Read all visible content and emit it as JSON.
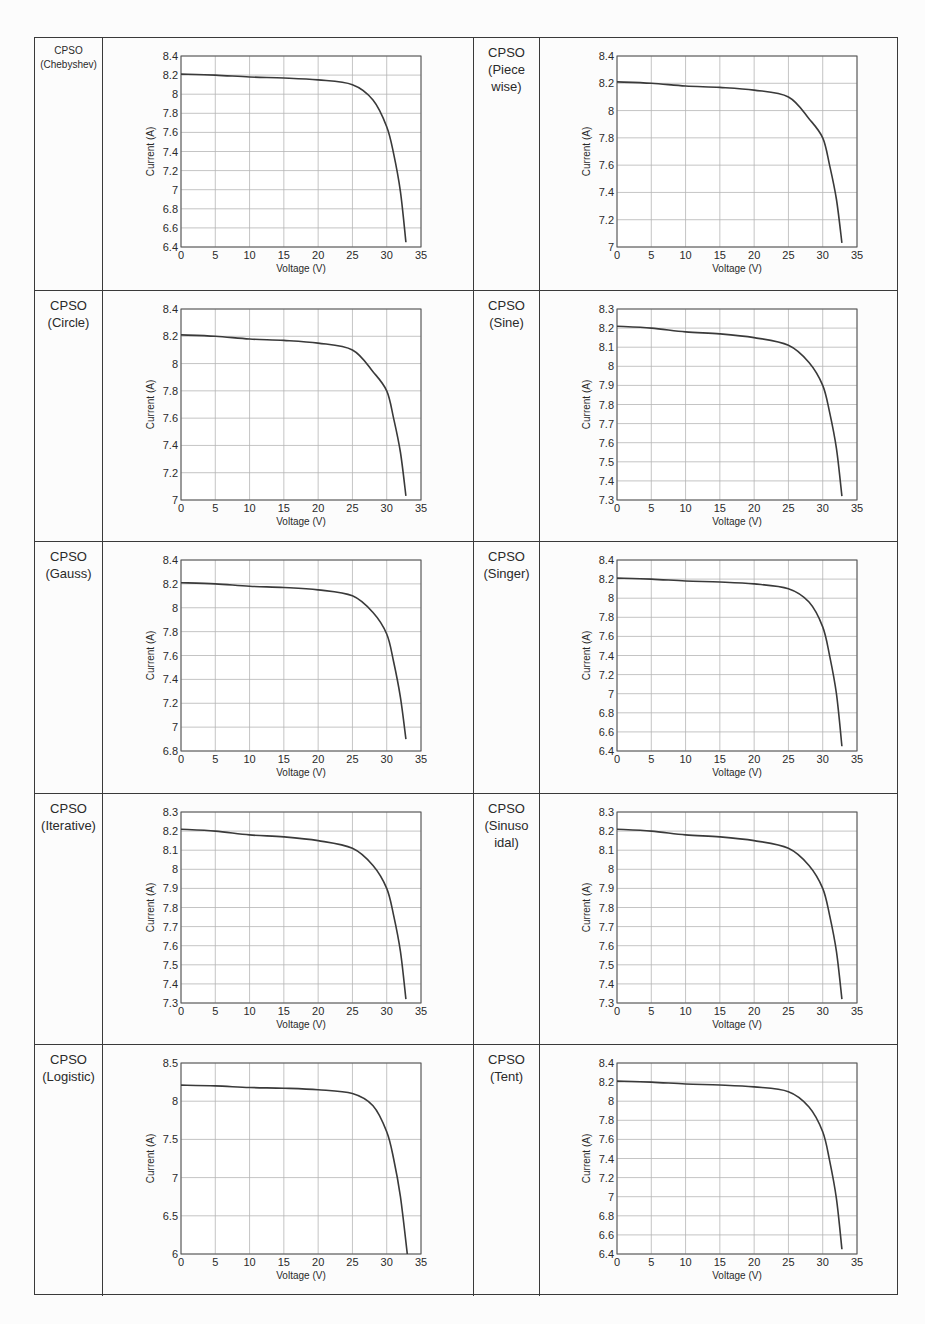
{
  "table": {
    "rows": [
      {
        "left": {
          "label": [
            "CPSO",
            "(Chebyshev)"
          ],
          "small": true,
          "chart_index": 0
        },
        "right": {
          "label": [
            "CPSO",
            "(Piece",
            "wise)"
          ],
          "small": false,
          "chart_index": 1
        }
      },
      {
        "left": {
          "label": [
            "CPSO",
            "(Circle)"
          ],
          "small": false,
          "chart_index": 2
        },
        "right": {
          "label": [
            "CPSO",
            "(Sine)"
          ],
          "small": false,
          "chart_index": 3
        }
      },
      {
        "left": {
          "label": [
            "CPSO",
            "(Gauss)"
          ],
          "small": false,
          "chart_index": 4
        },
        "right": {
          "label": [
            "CPSO",
            "(Singer)"
          ],
          "small": false,
          "chart_index": 5
        }
      },
      {
        "left": {
          "label": [
            "CPSO",
            "(Iterative)"
          ],
          "small": false,
          "chart_index": 6
        },
        "right": {
          "label": [
            "CPSO",
            "(Sinuso",
            "idal)"
          ],
          "small": false,
          "chart_index": 7
        }
      },
      {
        "left": {
          "label": [
            "CPSO",
            "(Logistic)"
          ],
          "small": false,
          "chart_index": 8
        },
        "right": {
          "label": [
            "CPSO",
            "(Tent)"
          ],
          "small": false,
          "chart_index": 9
        }
      }
    ]
  },
  "style": {
    "line_color": "#3a3a3a",
    "grid_color": "#b5b5b5",
    "frame_color": "#555555",
    "border_color": "#3a3a3a"
  },
  "chart_data": [
    {
      "type": "line",
      "title": "CPSO (Chebyshev)",
      "xlabel": "Voltage (V)",
      "ylabel": "Current (A)",
      "xlim": [
        0,
        35
      ],
      "ylim": [
        6.4,
        8.4
      ],
      "grid": true,
      "xticks": [
        0,
        5,
        10,
        15,
        20,
        25,
        30,
        35
      ],
      "yticks": [
        6.4,
        6.6,
        6.8,
        7,
        7.2,
        7.4,
        7.6,
        7.8,
        8,
        8.2,
        8.4
      ],
      "ytick_labels": [
        "6.4",
        "6.6",
        "6.8",
        "7",
        "7.2",
        "7.4",
        "7.6",
        "7.8",
        "8",
        "8.2",
        "8.4"
      ],
      "series": [
        {
          "name": "I-V curve",
          "x": [
            0,
            5,
            10,
            15,
            20,
            25,
            28,
            30,
            31,
            32,
            32.8
          ],
          "y": [
            8.21,
            8.2,
            8.18,
            8.17,
            8.15,
            8.1,
            7.94,
            7.66,
            7.38,
            6.98,
            6.45
          ]
        }
      ]
    },
    {
      "type": "line",
      "title": "CPSO (Piece wise)",
      "xlabel": "Voltage (V)",
      "ylabel": "Current (A)",
      "xlim": [
        0,
        35
      ],
      "ylim": [
        7,
        8.4
      ],
      "grid": true,
      "xticks": [
        0,
        5,
        10,
        15,
        20,
        25,
        30,
        35
      ],
      "yticks": [
        7,
        7.2,
        7.4,
        7.6,
        7.8,
        8,
        8.2,
        8.4
      ],
      "ytick_labels": [
        "7",
        "7.2",
        "7.4",
        "7.6",
        "7.8",
        "8",
        "8.2",
        "8.4"
      ],
      "series": [
        {
          "name": "I-V curve",
          "x": [
            0,
            5,
            10,
            15,
            20,
            25,
            28,
            30,
            31,
            32,
            32.8
          ],
          "y": [
            8.21,
            8.2,
            8.18,
            8.17,
            8.15,
            8.1,
            7.94,
            7.8,
            7.6,
            7.35,
            7.03
          ]
        }
      ]
    },
    {
      "type": "line",
      "title": "CPSO (Circle)",
      "xlabel": "Voltage (V)",
      "ylabel": "Current (A)",
      "xlim": [
        0,
        35
      ],
      "ylim": [
        7,
        8.4
      ],
      "grid": true,
      "xticks": [
        0,
        5,
        10,
        15,
        20,
        25,
        30,
        35
      ],
      "yticks": [
        7,
        7.2,
        7.4,
        7.6,
        7.8,
        8,
        8.2,
        8.4
      ],
      "ytick_labels": [
        "7",
        "7.2",
        "7.4",
        "7.6",
        "7.8",
        "8",
        "8.2",
        "8.4"
      ],
      "series": [
        {
          "name": "I-V curve",
          "x": [
            0,
            5,
            10,
            15,
            20,
            25,
            28,
            30,
            31,
            32,
            32.8
          ],
          "y": [
            8.21,
            8.2,
            8.18,
            8.17,
            8.15,
            8.1,
            7.94,
            7.8,
            7.6,
            7.35,
            7.03
          ]
        }
      ]
    },
    {
      "type": "line",
      "title": "CPSO (Sine)",
      "xlabel": "Voltage (V)",
      "ylabel": "Current (A)",
      "xlim": [
        0,
        35
      ],
      "ylim": [
        7.3,
        8.3
      ],
      "grid": true,
      "xticks": [
        0,
        5,
        10,
        15,
        20,
        25,
        30,
        35
      ],
      "yticks": [
        7.3,
        7.4,
        7.5,
        7.6,
        7.7,
        7.8,
        7.9,
        8,
        8.1,
        8.2,
        8.3
      ],
      "ytick_labels": [
        "7.3",
        "7.4",
        "7.5",
        "7.6",
        "7.7",
        "7.8",
        "7.9",
        "8",
        "8.1",
        "8.2",
        "8.3"
      ],
      "series": [
        {
          "name": "I-V curve",
          "x": [
            0,
            5,
            10,
            15,
            20,
            25,
            28,
            30,
            31,
            32,
            32.8
          ],
          "y": [
            8.21,
            8.2,
            8.18,
            8.17,
            8.15,
            8.11,
            8.02,
            7.9,
            7.76,
            7.57,
            7.32
          ]
        }
      ]
    },
    {
      "type": "line",
      "title": "CPSO (Gauss)",
      "xlabel": "Voltage (V)",
      "ylabel": "Current (A)",
      "xlim": [
        0,
        35
      ],
      "ylim": [
        6.8,
        8.4
      ],
      "grid": true,
      "xticks": [
        0,
        5,
        10,
        15,
        20,
        25,
        30,
        35
      ],
      "yticks": [
        6.8,
        7,
        7.2,
        7.4,
        7.6,
        7.8,
        8,
        8.2,
        8.4
      ],
      "ytick_labels": [
        "6.8",
        "7",
        "7.2",
        "7.4",
        "7.6",
        "7.8",
        "8",
        "8.2",
        "8.4"
      ],
      "series": [
        {
          "name": "I-V curve",
          "x": [
            0,
            5,
            10,
            15,
            20,
            25,
            28,
            30,
            31,
            32,
            32.8
          ],
          "y": [
            8.21,
            8.2,
            8.18,
            8.17,
            8.15,
            8.1,
            7.96,
            7.78,
            7.55,
            7.25,
            6.9
          ]
        }
      ]
    },
    {
      "type": "line",
      "title": "CPSO (Singer)",
      "xlabel": "Voltage (V)",
      "ylabel": "Current (A)",
      "xlim": [
        0,
        35
      ],
      "ylim": [
        6.4,
        8.4
      ],
      "grid": true,
      "xticks": [
        0,
        5,
        10,
        15,
        20,
        25,
        30,
        35
      ],
      "yticks": [
        6.4,
        6.6,
        6.8,
        7,
        7.2,
        7.4,
        7.6,
        7.8,
        8,
        8.2,
        8.4
      ],
      "ytick_labels": [
        "6.4",
        "6.6",
        "6.8",
        "7",
        "7.2",
        "7.4",
        "7.6",
        "7.8",
        "8",
        "8.2",
        "8.4"
      ],
      "series": [
        {
          "name": "I-V curve",
          "x": [
            0,
            5,
            10,
            15,
            20,
            25,
            28,
            30,
            31,
            32,
            32.8
          ],
          "y": [
            8.21,
            8.2,
            8.18,
            8.17,
            8.15,
            8.1,
            7.96,
            7.7,
            7.4,
            7.0,
            6.45
          ]
        }
      ]
    },
    {
      "type": "line",
      "title": "CPSO (Iterative)",
      "xlabel": "Voltage (V)",
      "ylabel": "Current (A)",
      "xlim": [
        0,
        35
      ],
      "ylim": [
        7.3,
        8.3
      ],
      "grid": true,
      "xticks": [
        0,
        5,
        10,
        15,
        20,
        25,
        30,
        35
      ],
      "yticks": [
        7.3,
        7.4,
        7.5,
        7.6,
        7.7,
        7.8,
        7.9,
        8,
        8.1,
        8.2,
        8.3
      ],
      "ytick_labels": [
        "7.3",
        "7.4",
        "7.5",
        "7.6",
        "7.7",
        "7.8",
        "7.9",
        "8",
        "8.1",
        "8.2",
        "8.3"
      ],
      "series": [
        {
          "name": "I-V curve",
          "x": [
            0,
            5,
            10,
            15,
            20,
            25,
            28,
            30,
            31,
            32,
            32.8
          ],
          "y": [
            8.21,
            8.2,
            8.18,
            8.17,
            8.15,
            8.11,
            8.02,
            7.9,
            7.76,
            7.57,
            7.32
          ]
        }
      ]
    },
    {
      "type": "line",
      "title": "CPSO (Sinusoidal)",
      "xlabel": "Voltage (V)",
      "ylabel": "Current (A)",
      "xlim": [
        0,
        35
      ],
      "ylim": [
        7.3,
        8.3
      ],
      "grid": true,
      "xticks": [
        0,
        5,
        10,
        15,
        20,
        25,
        30,
        35
      ],
      "yticks": [
        7.3,
        7.4,
        7.5,
        7.6,
        7.7,
        7.8,
        7.9,
        8,
        8.1,
        8.2,
        8.3
      ],
      "ytick_labels": [
        "7.3",
        "7.4",
        "7.5",
        "7.6",
        "7.7",
        "7.8",
        "7.9",
        "8",
        "8.1",
        "8.2",
        "8.3"
      ],
      "series": [
        {
          "name": "I-V curve",
          "x": [
            0,
            5,
            10,
            15,
            20,
            25,
            28,
            30,
            31,
            32,
            32.8
          ],
          "y": [
            8.21,
            8.2,
            8.18,
            8.17,
            8.15,
            8.11,
            8.02,
            7.9,
            7.76,
            7.57,
            7.32
          ]
        }
      ]
    },
    {
      "type": "line",
      "title": "CPSO (Logistic)",
      "xlabel": "Voltage (V)",
      "ylabel": "Current (A)",
      "xlim": [
        0,
        35
      ],
      "ylim": [
        6,
        8.5
      ],
      "grid": true,
      "xticks": [
        0,
        5,
        10,
        15,
        20,
        25,
        30,
        35
      ],
      "yticks": [
        6,
        6.5,
        7,
        7.5,
        8,
        8.5
      ],
      "ytick_labels": [
        "6",
        "6.5",
        "7",
        "7.5",
        "8",
        "8.5"
      ],
      "series": [
        {
          "name": "I-V curve",
          "x": [
            0,
            5,
            10,
            15,
            20,
            25,
            28,
            30,
            31,
            32,
            33
          ],
          "y": [
            8.21,
            8.2,
            8.18,
            8.17,
            8.15,
            8.1,
            7.94,
            7.6,
            7.25,
            6.75,
            6.0
          ]
        }
      ]
    },
    {
      "type": "line",
      "title": "CPSO (Tent)",
      "xlabel": "Voltage (V)",
      "ylabel": "Current (A)",
      "xlim": [
        0,
        35
      ],
      "ylim": [
        6.4,
        8.4
      ],
      "grid": true,
      "xticks": [
        0,
        5,
        10,
        15,
        20,
        25,
        30,
        35
      ],
      "yticks": [
        6.4,
        6.6,
        6.8,
        7,
        7.2,
        7.4,
        7.6,
        7.8,
        8,
        8.2,
        8.4
      ],
      "ytick_labels": [
        "6.4",
        "6.6",
        "6.8",
        "7",
        "7.2",
        "7.4",
        "7.6",
        "7.8",
        "8",
        "8.2",
        "8.4"
      ],
      "series": [
        {
          "name": "I-V curve",
          "x": [
            0,
            5,
            10,
            15,
            20,
            25,
            28,
            30,
            31,
            32,
            32.8
          ],
          "y": [
            8.21,
            8.2,
            8.18,
            8.17,
            8.15,
            8.1,
            7.94,
            7.68,
            7.38,
            6.98,
            6.45
          ]
        }
      ]
    }
  ]
}
